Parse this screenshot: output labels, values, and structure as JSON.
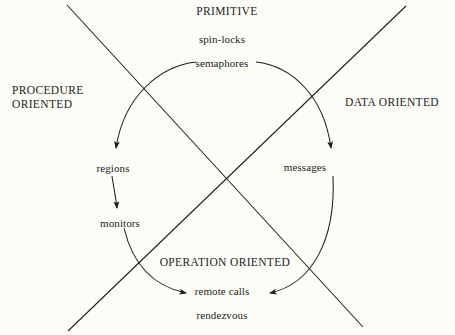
{
  "diagram": {
    "background_color": "#fdfdf8",
    "stroke_color": "#1c1c1c",
    "axis_labels": {
      "top": "PRIMITIVE",
      "left_line1": "PROCEDURE",
      "left_line2": "ORIENTED",
      "right": "DATA ORIENTED",
      "bottom": "OPERATION ORIENTED"
    },
    "terms": {
      "spin_locks": "spin-locks",
      "semaphores": "semaphores",
      "regions": "regions",
      "messages": "messages",
      "monitors": "monitors",
      "remote_calls": "remote calls",
      "rendezvous": "rendezvous"
    },
    "arrows": [
      {
        "name": "semaphores-to-regions",
        "from": "semaphores",
        "to": "regions",
        "shape": "arc-left-down"
      },
      {
        "name": "semaphores-to-messages",
        "from": "semaphores",
        "to": "messages",
        "shape": "arc-right-down"
      },
      {
        "name": "regions-to-monitors",
        "from": "regions",
        "to": "monitors",
        "shape": "straight-down"
      },
      {
        "name": "monitors-to-remote-calls",
        "from": "monitors",
        "to": "remote calls",
        "shape": "arc-left-down"
      },
      {
        "name": "messages-to-remote-calls",
        "from": "messages",
        "to": "remote calls",
        "shape": "arc-right-down"
      }
    ],
    "cross_lines": [
      {
        "name": "diagonal-nw-se",
        "from": "top-left",
        "to": "bottom-right"
      },
      {
        "name": "diagonal-ne-sw",
        "from": "top-right",
        "to": "bottom-left"
      }
    ]
  }
}
